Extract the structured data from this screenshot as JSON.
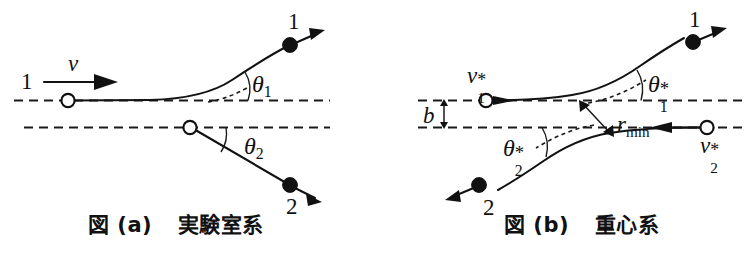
{
  "figure": {
    "panels": [
      {
        "id": "panel-a",
        "caption": "図 (a)  実験室系",
        "caption_label": "図 (a)",
        "caption_text": "実験室系",
        "labels": {
          "incoming_particle": "1",
          "velocity": "v",
          "angle_1": "θ",
          "angle_1_sub": "1",
          "angle_2": "θ",
          "angle_2_sub": "2",
          "outgoing_particle_1": "1",
          "outgoing_particle_2": "2"
        }
      },
      {
        "id": "panel-b",
        "caption": "図 (b)  重心系",
        "caption_label": "図 (b)",
        "caption_text": "重心系",
        "labels": {
          "velocity_1": "v",
          "velocity_1_sub": "1",
          "velocity_1_sup": "*",
          "velocity_2": "v",
          "velocity_2_sub": "2",
          "velocity_2_sup": "*",
          "impact_parameter": "b",
          "min_distance": "r",
          "min_distance_sub": "min",
          "angle_1": "θ",
          "angle_1_sub": "1",
          "angle_1_sup": "*",
          "angle_2": "θ",
          "angle_2_sub": "2",
          "angle_2_sup": "*",
          "outgoing_particle_1": "1",
          "outgoing_particle_2": "2"
        }
      }
    ],
    "colors": {
      "ink": "#111111",
      "background": "#ffffff"
    }
  }
}
